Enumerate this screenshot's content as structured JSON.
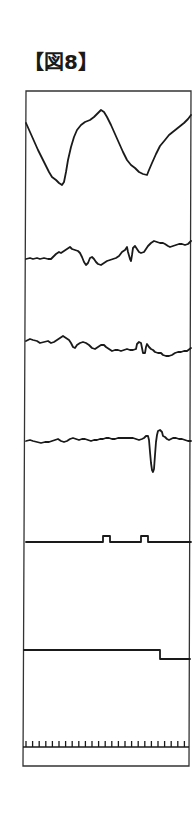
{
  "figure": {
    "title": "【図8】",
    "frame": {
      "top_left": [
        26,
        91
      ],
      "top_right": [
        191,
        91
      ],
      "bottom_right": [
        189,
        766
      ],
      "bottom_left": [
        23,
        766
      ]
    },
    "traces": [
      {
        "name": "trace-1-large-wave",
        "points": "26,123 30,132 34,141 38,150 42,158 46,166 49,172 52,177 56,180 59,183 62,185 64,182 66,172 68,160 71,147 74,137 77,130 81,125 85,122 90,120 94,117 98,113 101,110 104,112 107,117 111,125 115,134 119,143 123,152 127,160 131,165 135,168 139,172 143,174 147,175 149,170 152,163 156,154 160,146 165,140 169,135 174,131 179,127 184,123 188,119 191,115"
      },
      {
        "name": "trace-2-noisy",
        "points": "26,259 30,258 33,259 37,258 40,259 44,258 48,259 51,259 53,257 56,254 59,252 61,253 64,251 67,249 70,247 72,249 75,250 78,251 80,253 82,257 84,262 86,265 88,263 90,258 92,257 94,259 96,262 98,264 101,265 104,263 107,261 110,260 113,259 116,258 119,256 122,252 125,250 127,247 128,252 130,259 131,261 132,255 133,248 135,246 137,249 139,252 141,253 144,252 146,249 148,246 151,243 154,241 157,242 160,243 163,243 165,244 168,246 170,247 173,246 176,245 179,244 182,244 185,245 188,244 191,241"
      },
      {
        "name": "trace-3-noisy",
        "points": "26,341 30,339 33,340 37,341 40,343 44,342 48,341 51,343 54,342 57,340 60,338 63,336 66,338 69,340 71,343 73,347 75,348 77,345 80,343 83,342 86,343 89,345 92,348 95,349 98,347 101,345 104,345 106,347 109,349 112,351 115,350 118,350 121,351 124,350 127,349 130,350 133,350 136,349 137,344 139,342 141,343 142,348 143,353 145,353 146,347 147,344 149,347 151,349 153,350 155,352 158,353 161,353 163,355 166,356 169,356 172,355 175,353 178,352 181,352 184,351 187,351 191,348"
      },
      {
        "name": "trace-4-spike",
        "points": "26,441 30,440 33,441 37,442 41,443 45,442 49,442 52,441 55,440 58,439 61,441 64,442 67,441 70,439 73,438 76,439 79,440 82,439 85,439 88,440 91,441 94,440 97,440 100,439 103,439 106,438 109,438 112,439 115,439 118,438 121,438 124,438 127,438 130,438 133,438 136,439 139,440 142,439 144,438 146,436 148,436 149,440 150,452 151,463 152,470 153,472 154,469 155,455 156,442 157,435 158,431 160,430 162,432 163,436 165,437 167,439 169,440 171,439 173,438 176,438 179,439 182,439 185,440 188,441 191,441"
      },
      {
        "name": "trace-5-pulses",
        "points": "26,542 103,542 103,536 110,536 110,542 141,542 141,536 148,536 148,542 191,542"
      },
      {
        "name": "trace-6-step",
        "points": "24,650 160,650 160,659 190,659"
      }
    ],
    "time_axis": {
      "baseline": {
        "x1": 23,
        "x2": 189,
        "y": 747
      },
      "tick_top_y": 741,
      "tick_start_x": 26,
      "tick_spacing": 6.6,
      "tick_count": 25
    }
  }
}
